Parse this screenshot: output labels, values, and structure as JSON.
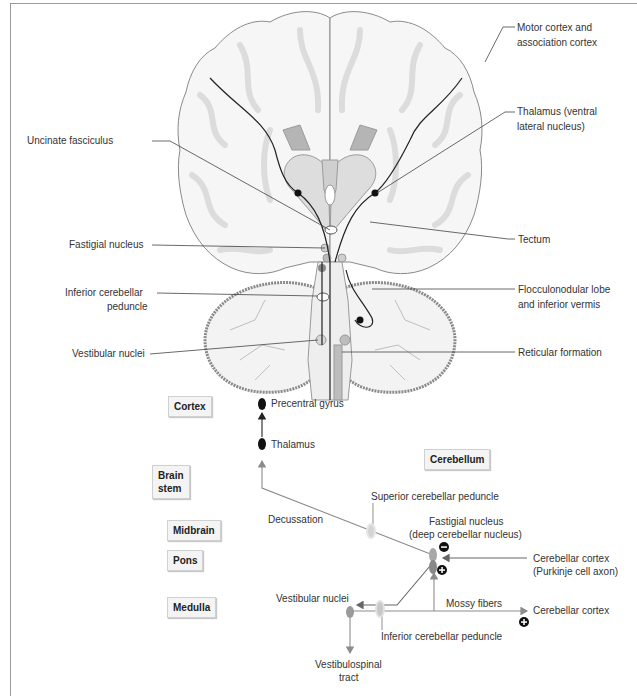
{
  "figure": {
    "top_panel": {
      "title": "Coronal brain section with cerebellar pathways",
      "left_labels": [
        {
          "id": "uncinate",
          "text": "Uncinate fasciculus"
        },
        {
          "id": "fastigial",
          "text": "Fastigial nucleus"
        },
        {
          "id": "icp_line1",
          "text": "Inferior cerebellar"
        },
        {
          "id": "icp_line2",
          "text": "peduncle"
        },
        {
          "id": "vestibular",
          "text": "Vestibular nuclei"
        }
      ],
      "right_labels": [
        {
          "id": "motor_line1",
          "text": "Motor cortex and"
        },
        {
          "id": "motor_line2",
          "text": "association cortex"
        },
        {
          "id": "thal_line1",
          "text": "Thalamus (ventral"
        },
        {
          "id": "thal_line2",
          "text": "lateral nucleus)"
        },
        {
          "id": "tectum",
          "text": "Tectum"
        },
        {
          "id": "floc_line1",
          "text": "Flocculonodular lobe"
        },
        {
          "id": "floc_line2",
          "text": "and inferior vermis"
        },
        {
          "id": "reticular",
          "text": "Reticular formation"
        }
      ]
    },
    "bottom_panel": {
      "level_boxes": {
        "cortex": "Cortex",
        "brainstem_line1": "Brain",
        "brainstem_line2": "stem",
        "midbrain": "Midbrain",
        "pons": "Pons",
        "medulla": "Medulla",
        "cerebellum": "Cerebellum"
      },
      "nodes": {
        "precentral": "Precentral gyrus",
        "thalamus": "Thalamus",
        "decussation": "Decussation",
        "scp": "Superior cerebellar peduncle",
        "fastigial_line1": "Fastigial nucleus",
        "fastigial_line2": "(deep cerebellar nucleus)",
        "purkinje_line1": "Cerebellar cortex",
        "purkinje_line2": "(Purkinje cell axon)",
        "vestibular": "Vestibular nuclei",
        "mossy": "Mossy fibers",
        "cerebellar_cortex": "Cerebellar cortex",
        "icp": "Inferior cerebellar peduncle",
        "vst_line1": "Vestibulospinal",
        "vst_line2": "tract"
      },
      "signs": {
        "inhibitory": "−",
        "excitatory": "+"
      }
    },
    "colors": {
      "border": "#9a9a9a",
      "pathway_gray": "#8c8c8c",
      "pathway_dark": "#222222",
      "tissue_light": "#efefef",
      "tissue_mid": "#d6d6d6",
      "label_box_bg": "#f4f4f4"
    }
  }
}
